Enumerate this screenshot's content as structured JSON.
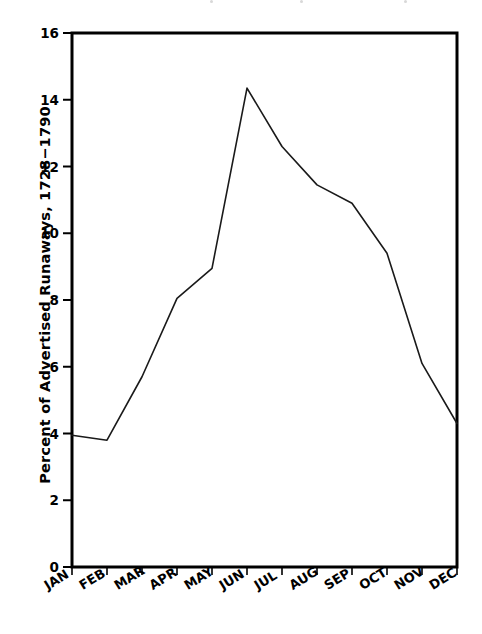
{
  "chart_data": {
    "type": "line",
    "title": "",
    "xlabel": "",
    "ylabel": "Percent of Advertised Runaways, 1728−1790",
    "categories": [
      "JAN",
      "FEB",
      "MAR",
      "APR",
      "MAY",
      "JUN",
      "JUL",
      "AUG",
      "SEP",
      "OCT",
      "NOV",
      "DEC"
    ],
    "values": [
      3.95,
      3.8,
      5.7,
      8.05,
      8.95,
      14.35,
      12.6,
      11.45,
      10.9,
      9.4,
      6.1,
      4.3
    ],
    "ylim": [
      0,
      16
    ],
    "yticks": [
      0,
      2,
      4,
      6,
      8,
      10,
      12,
      14,
      16
    ],
    "ytick_labels": [
      "0",
      "2",
      "4",
      "6",
      "8",
      "10",
      "12",
      "14",
      "16"
    ],
    "grid": false,
    "legend": "none",
    "series_color": "#1a1a1a",
    "axis_color": "#000000",
    "background_color": "#ffffff"
  },
  "plot": {
    "frame_left": 72,
    "frame_right": 457,
    "frame_top": 33,
    "frame_bottom": 567
  }
}
